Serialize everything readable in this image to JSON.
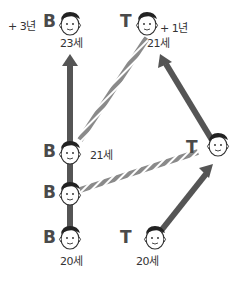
{
  "colors": {
    "arrow": "#555555",
    "rope": "#888888",
    "rope_stripe": "#ffffff",
    "text": "#333333"
  },
  "labels": {
    "b_extra": "+ 3년",
    "t_extra": "+ 1년",
    "b_top_age": "23세",
    "t_top_age": "21세",
    "b_mid_age": "21세",
    "b_start_age": "20세",
    "t_start_age": "20세"
  },
  "letters": {
    "b": "B",
    "t": "T"
  },
  "nodes": [
    {
      "id": "b-start",
      "letter": "B",
      "age": "20세"
    },
    {
      "id": "b-lower-mid",
      "letter": "B"
    },
    {
      "id": "b-mid",
      "letter": "B",
      "age": "21세"
    },
    {
      "id": "b-top",
      "letter": "B",
      "age": "23세",
      "extra": "+ 3년"
    },
    {
      "id": "t-start",
      "letter": "T",
      "age": "20세"
    },
    {
      "id": "t-turn",
      "letter": "T"
    },
    {
      "id": "t-top",
      "letter": "T",
      "age": "21세",
      "extra": "+ 1년"
    }
  ]
}
